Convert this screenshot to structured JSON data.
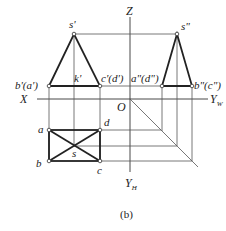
{
  "figure": {
    "caption": "(b)",
    "axes": {
      "z": "Z",
      "x": "X",
      "origin": "O",
      "yw": "Y",
      "yw_sub": "W",
      "yh": "Y",
      "yh_sub": "H"
    },
    "front_view": {
      "apex": "s'",
      "left_base": "b'(a')",
      "mid_base": "k'",
      "right_base": "c'(d')"
    },
    "side_view": {
      "apex": "s\"",
      "left_base": "a\"(d\")",
      "right_base": "b\"(c\")"
    },
    "top_view": {
      "a": "a",
      "b": "b",
      "c": "c",
      "d": "d",
      "s": "s"
    },
    "colors": {
      "line": "#222222",
      "projection_line": "#555555",
      "background": "#ffffff"
    }
  }
}
